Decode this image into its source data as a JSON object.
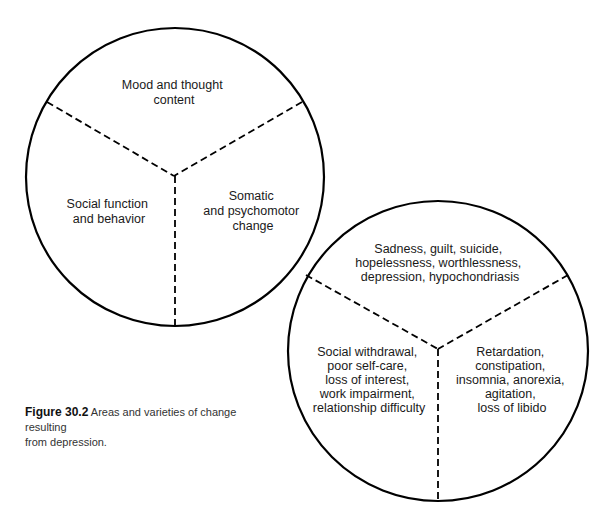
{
  "figure": {
    "number_label": "Figure 30.2",
    "caption_line1": "Areas and varieties of change resulting",
    "caption_line2": "from depression."
  },
  "circle_areas": {
    "top": [
      "Mood and thought",
      "content"
    ],
    "left": [
      "Social function",
      "and behavior"
    ],
    "right": [
      "Somatic",
      "and psychomotor",
      "change"
    ]
  },
  "circle_varieties": {
    "top": [
      "Sadness, guilt, suicide,",
      "hopelessness, worthlessness,",
      "depression, hypochondriasis"
    ],
    "left": [
      "Social withdrawal,",
      "poor self-care,",
      "loss of interest,",
      "work impairment,",
      "relationship difficulty"
    ],
    "right": [
      "Retardation,",
      "constipation,",
      "insomnia, anorexia,",
      "agitation,",
      "loss of libido"
    ]
  },
  "colors": {
    "stroke": "#000000",
    "text": "#1a1a1a",
    "background": "#ffffff"
  }
}
